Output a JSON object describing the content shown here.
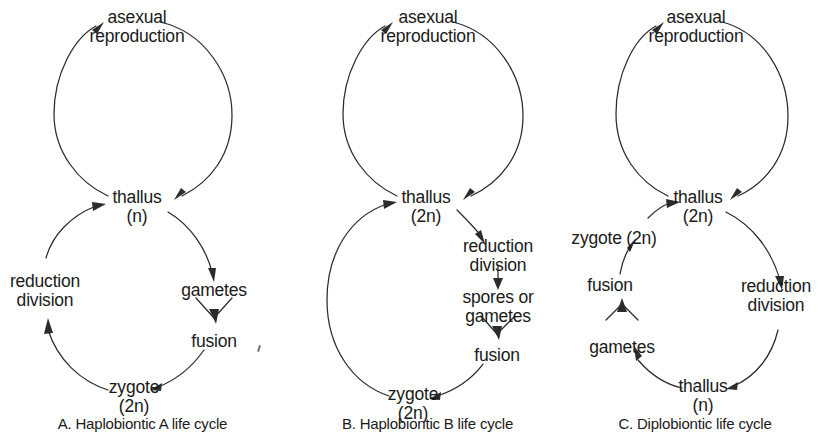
{
  "figure": {
    "background_color": "#ffffff",
    "line_color": "#2b2b2b",
    "text_color": "#1a1a1a"
  },
  "panels": [
    {
      "id": "A",
      "caption": "A. Haplobiontic A life cycle",
      "nodes": {
        "asexual": {
          "line1": "asexual",
          "line2": "reproduction"
        },
        "thallus": {
          "line1": "thallus",
          "line2": "(n)"
        },
        "gametes": {
          "line1": "gametes"
        },
        "fusion": {
          "line1": "fusion"
        },
        "zygote": {
          "line1": "zygote",
          "line2": "(2n)"
        },
        "reduction": {
          "line1": "reduction",
          "line2": "division"
        }
      }
    },
    {
      "id": "B",
      "caption": "B. Haplobiontic B life cycle",
      "nodes": {
        "asexual": {
          "line1": "asexual",
          "line2": "reproduction"
        },
        "thallus": {
          "line1": "thallus",
          "line2": "(2n)"
        },
        "reduction": {
          "line1": "reduction",
          "line2": "division"
        },
        "spores": {
          "line1": "spores or",
          "line2": "gametes"
        },
        "fusion": {
          "line1": "fusion"
        },
        "zygote": {
          "line1": "zygote",
          "line2": "(2n)"
        }
      }
    },
    {
      "id": "C",
      "caption": "C. Diplobiontic life cycle",
      "nodes": {
        "asexual": {
          "line1": "asexual",
          "line2": "reproduction"
        },
        "thallus_2n": {
          "line1": "thallus",
          "line2": "(2n)"
        },
        "reduction": {
          "line1": "reduction",
          "line2": "division"
        },
        "thallus_n": {
          "line1": "thallus",
          "line2": "(n)"
        },
        "gametes": {
          "line1": "gametes"
        },
        "fusion": {
          "line1": "fusion"
        },
        "zygote": {
          "line1": "zygote (2n)"
        }
      }
    }
  ]
}
